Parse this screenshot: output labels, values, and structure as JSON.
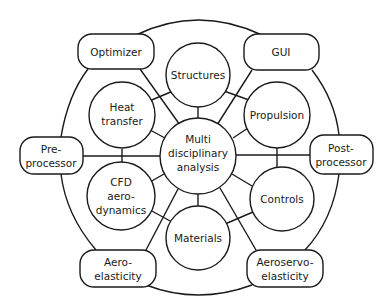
{
  "diagram": {
    "center": {
      "id": "mda",
      "lines": [
        "Multi",
        "disciplinary",
        "analysis"
      ]
    },
    "inner_ring": [
      {
        "id": "structures",
        "lines": [
          "Structures"
        ]
      },
      {
        "id": "propulsion",
        "lines": [
          "Propulsion"
        ]
      },
      {
        "id": "controls",
        "lines": [
          "Controls"
        ]
      },
      {
        "id": "materials",
        "lines": [
          "Materials"
        ]
      },
      {
        "id": "cfd",
        "lines": [
          "CFD",
          "aero-",
          "dynamics"
        ]
      },
      {
        "id": "heat",
        "lines": [
          "Heat",
          "transfer"
        ]
      }
    ],
    "outer_ring": [
      {
        "id": "optimizer",
        "lines": [
          "Optimizer"
        ]
      },
      {
        "id": "gui",
        "lines": [
          "GUI"
        ]
      },
      {
        "id": "postprocessor",
        "lines": [
          "Post-",
          "processor"
        ]
      },
      {
        "id": "aeroservo",
        "lines": [
          "Aeroservo-",
          "elasticity"
        ]
      },
      {
        "id": "aeroelasticity",
        "lines": [
          "Aero-",
          "elasticity"
        ]
      },
      {
        "id": "preprocessor",
        "lines": [
          "Pre-",
          "processor"
        ]
      }
    ],
    "colors": {
      "stroke": "#1a1a1a",
      "fill": "#ffffff",
      "background": "#ffffff"
    }
  }
}
